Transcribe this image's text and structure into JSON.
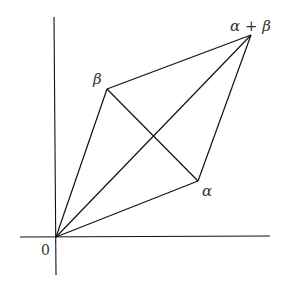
{
  "diagram": {
    "axes": {
      "x_axis": {
        "x1": 20,
        "y1": 237,
        "x2": 270,
        "y2": 236
      },
      "y_axis": {
        "x1": 54,
        "y1": 17,
        "x2": 56,
        "y2": 275
      }
    },
    "points": {
      "origin": {
        "x": 56,
        "y": 237,
        "label": "0"
      },
      "alpha": {
        "x": 198,
        "y": 181,
        "label": "α"
      },
      "beta": {
        "x": 107,
        "y": 89,
        "label": "β"
      },
      "alpha_plus_beta": {
        "x": 251,
        "y": 35,
        "label": "α + β"
      }
    },
    "labels": {
      "origin": "0",
      "alpha": "α",
      "beta": "β",
      "alpha_plus_beta": "α + β"
    },
    "edges": [
      [
        "origin",
        "alpha"
      ],
      [
        "origin",
        "beta"
      ],
      [
        "beta",
        "alpha_plus_beta"
      ],
      [
        "alpha",
        "alpha_plus_beta"
      ],
      [
        "origin",
        "alpha_plus_beta"
      ],
      [
        "beta",
        "alpha"
      ]
    ]
  }
}
